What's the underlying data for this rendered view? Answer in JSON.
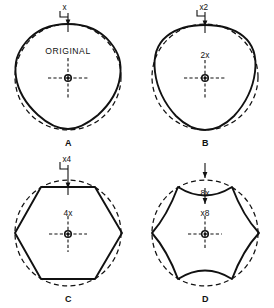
{
  "figure": {
    "stroke_color": "#111111",
    "background_color": "#ffffff"
  },
  "panels": [
    {
      "id": "A",
      "caption": "A",
      "inner_label": "ORIGINAL",
      "callout_label": "x",
      "lobe_count": 6,
      "shape": "near-circular rounded hexagon",
      "reference_circle": "dashed",
      "center_marker": "crosshair-with-dot"
    },
    {
      "id": "B",
      "caption": "B",
      "inner_label": "2x",
      "callout_label": "x2",
      "lobe_count": 6,
      "shape": "rounded hexagon",
      "reference_circle": "dashed",
      "center_marker": "crosshair-with-dot"
    },
    {
      "id": "C",
      "caption": "C",
      "inner_label": "4x",
      "callout_label": "x4",
      "lobe_count": 6,
      "shape": "hexagon",
      "reference_circle": "dashed",
      "center_marker": "crosshair-with-dot"
    },
    {
      "id": "D",
      "caption": "D",
      "inner_label": "x8",
      "callout_label": "8x",
      "lobe_count": 6,
      "shape": "concave six-lobed star",
      "reference_circle": "dashed",
      "center_marker": "crosshair-with-dot"
    }
  ]
}
